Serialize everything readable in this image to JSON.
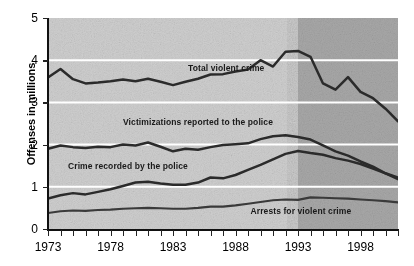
{
  "chart_data": {
    "type": "line",
    "title": "",
    "xlabel": "",
    "ylabel": "Offenses in millions",
    "xlim": [
      1973,
      2001
    ],
    "ylim": [
      0,
      5
    ],
    "grid": true,
    "gridlines_y": [
      1,
      2,
      3,
      4
    ],
    "legend_position": "inline-annotations",
    "y_ticks": [
      "0",
      "1",
      "2",
      "3",
      "4",
      "5"
    ],
    "x_ticks": [
      "1973",
      "1978",
      "1983",
      "1988",
      "1993",
      "1998"
    ],
    "x_tick_years": [
      1973,
      1978,
      1983,
      1988,
      1993,
      1998
    ],
    "x_minor_tick_years": [
      1973,
      1974,
      1975,
      1976,
      1977,
      1978,
      1979,
      1980,
      1981,
      1982,
      1983,
      1984,
      1985,
      1986,
      1987,
      1988,
      1989,
      1990,
      1991,
      1992,
      1993,
      1994,
      1995,
      1996,
      1997,
      1998,
      1999,
      2000,
      2001
    ],
    "shaded_region": {
      "label": "darker background band",
      "from_year": 1993,
      "to_year": 2001,
      "early_color": "#cfcfcf",
      "late_color": "#a8a8a8"
    },
    "x": [
      1973,
      1974,
      1975,
      1976,
      1977,
      1978,
      1979,
      1980,
      1981,
      1982,
      1983,
      1984,
      1985,
      1986,
      1987,
      1988,
      1989,
      1990,
      1991,
      1992,
      1993,
      1994,
      1995,
      1996,
      1997,
      1998,
      1999,
      2000,
      2001
    ],
    "series": [
      {
        "name": "Total violent crime",
        "color": "#2b2b2b",
        "label_x_year": 1984.2,
        "label_y_value": 3.78,
        "values": [
          3.59,
          3.79,
          3.55,
          3.45,
          3.47,
          3.5,
          3.54,
          3.5,
          3.56,
          3.49,
          3.41,
          3.49,
          3.56,
          3.66,
          3.67,
          3.73,
          3.78,
          4.0,
          3.85,
          4.2,
          4.22,
          4.08,
          3.45,
          3.3,
          3.6,
          3.25,
          3.1,
          2.85,
          2.55
        ]
      },
      {
        "name": "Victimizations reported to the police",
        "color": "#2b2b2b",
        "label_x_year": 1979.0,
        "label_y_value": 2.52,
        "values": [
          1.9,
          1.98,
          1.94,
          1.92,
          1.95,
          1.94,
          2.0,
          1.98,
          2.05,
          1.95,
          1.84,
          1.9,
          1.88,
          1.94,
          1.99,
          2.01,
          2.03,
          2.13,
          2.2,
          2.22,
          2.18,
          2.12,
          1.98,
          1.84,
          1.74,
          1.6,
          1.48,
          1.32,
          1.18
        ]
      },
      {
        "name": "Crime recorded by the police",
        "color": "#2b2b2b",
        "label_x_year": 1974.6,
        "label_y_value": 1.48,
        "values": [
          0.72,
          0.8,
          0.85,
          0.82,
          0.88,
          0.94,
          1.02,
          1.1,
          1.12,
          1.08,
          1.05,
          1.05,
          1.1,
          1.22,
          1.2,
          1.28,
          1.4,
          1.52,
          1.65,
          1.78,
          1.85,
          1.8,
          1.76,
          1.68,
          1.62,
          1.54,
          1.43,
          1.32,
          1.22
        ]
      },
      {
        "name": "Arrests for violent crime",
        "color": "#3a3a3a",
        "label_x_year": 1989.2,
        "label_y_value": 0.4,
        "values": [
          0.38,
          0.42,
          0.44,
          0.43,
          0.45,
          0.46,
          0.48,
          0.49,
          0.5,
          0.49,
          0.48,
          0.48,
          0.5,
          0.53,
          0.53,
          0.56,
          0.6,
          0.64,
          0.68,
          0.7,
          0.69,
          0.75,
          0.74,
          0.73,
          0.72,
          0.7,
          0.68,
          0.66,
          0.63
        ]
      }
    ]
  }
}
